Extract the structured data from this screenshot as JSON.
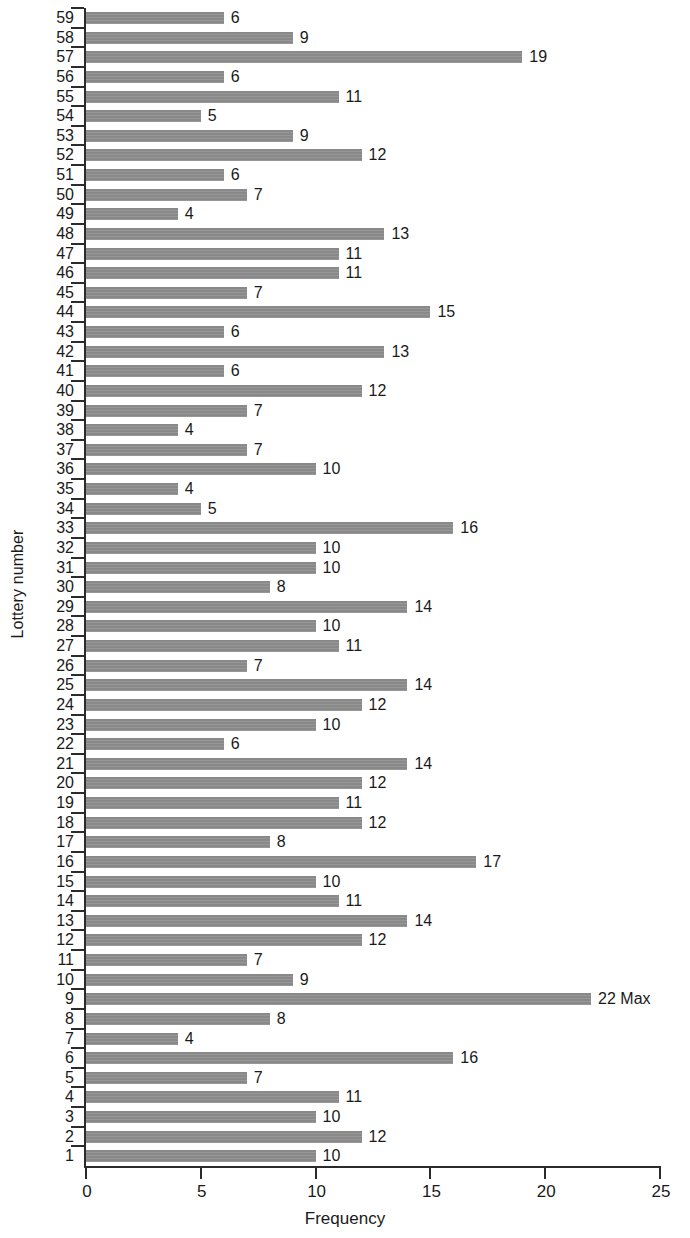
{
  "chart_data": {
    "type": "bar",
    "orientation": "horizontal",
    "title": "",
    "xlabel": "Frequency",
    "ylabel": "Lottery number",
    "xlim": [
      0,
      25
    ],
    "xticks": [
      0,
      5,
      10,
      15,
      20,
      25
    ],
    "grid": false,
    "legend": null,
    "bar_color": "#8e8e8e",
    "axis_color": "#2b2b2b",
    "value_labels_shown": true,
    "annotations": [
      {
        "category": "9",
        "text": "Max",
        "note": "appears after the value label 22 on the longest bar"
      }
    ],
    "categories": [
      "59",
      "58",
      "57",
      "56",
      "55",
      "54",
      "53",
      "52",
      "51",
      "50",
      "49",
      "48",
      "47",
      "46",
      "45",
      "44",
      "43",
      "42",
      "41",
      "40",
      "39",
      "38",
      "37",
      "36",
      "35",
      "34",
      "33",
      "32",
      "31",
      "30",
      "29",
      "28",
      "27",
      "26",
      "25",
      "24",
      "23",
      "22",
      "21",
      "20",
      "19",
      "18",
      "17",
      "16",
      "15",
      "14",
      "13",
      "12",
      "11",
      "10",
      "9",
      "8",
      "7",
      "6",
      "5",
      "4",
      "3",
      "2",
      "1"
    ],
    "values": [
      6,
      9,
      19,
      6,
      11,
      5,
      9,
      12,
      6,
      7,
      4,
      13,
      11,
      11,
      7,
      15,
      6,
      13,
      6,
      12,
      7,
      4,
      7,
      10,
      4,
      5,
      16,
      10,
      10,
      8,
      14,
      10,
      11,
      7,
      14,
      12,
      10,
      6,
      14,
      12,
      11,
      12,
      8,
      17,
      10,
      11,
      14,
      12,
      7,
      9,
      22,
      8,
      4,
      16,
      7,
      11,
      10,
      12,
      10
    ],
    "value_label_suffixes": [
      "",
      "",
      "",
      "",
      "",
      "",
      "",
      "",
      "",
      "",
      "",
      "",
      "",
      "",
      "",
      "",
      "",
      "",
      "",
      "",
      "",
      "",
      "",
      "",
      "",
      "",
      "",
      "",
      "",
      "",
      "",
      "",
      "",
      "",
      "",
      "",
      "",
      "",
      "",
      "",
      "",
      "",
      "",
      "",
      "",
      "",
      "",
      "",
      "",
      "",
      " Max",
      "",
      "",
      "",
      "",
      "",
      "",
      "",
      ""
    ],
    "max": {
      "category": "9",
      "value": 22,
      "label": "22 Max"
    },
    "min_value": 4,
    "total_categories": 59
  },
  "axis": {
    "x_title": "Frequency",
    "y_title": "Lottery number",
    "x_tick_labels": [
      "0",
      "5",
      "10",
      "15",
      "20",
      "25"
    ]
  }
}
